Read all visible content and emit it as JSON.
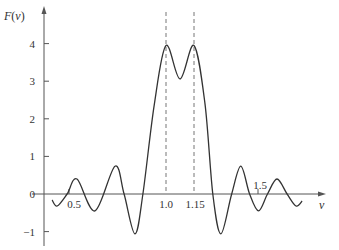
{
  "chart_data": {
    "type": "line",
    "title": "",
    "xlabel": "ν",
    "ylabel": "F(ν)",
    "ylabel_parts": {
      "func": "F",
      "open": "(",
      "var": "ν",
      "close": ")"
    },
    "xlim": [
      0.42,
      1.81
    ],
    "ylim": [
      -1.2,
      4.9
    ],
    "grid": false,
    "legend": "none",
    "x_ticks": [
      {
        "value": 0.5,
        "label": "0.5"
      },
      {
        "value": 1.0,
        "label": "1.0"
      },
      {
        "value": 1.15,
        "label": "1.15"
      },
      {
        "value": 1.5,
        "label": "1.5"
      }
    ],
    "y_ticks": [
      {
        "value": -1,
        "label": "−1"
      },
      {
        "value": 0,
        "label": "0"
      },
      {
        "value": 1,
        "label": "1"
      },
      {
        "value": 2,
        "label": "2"
      },
      {
        "value": 3,
        "label": "3"
      },
      {
        "value": 4,
        "label": "4"
      }
    ],
    "reference_lines": [
      {
        "x": 1.0,
        "style": "dashed"
      },
      {
        "x": 1.15,
        "style": "dashed"
      }
    ],
    "series": [
      {
        "name": "F(ν)",
        "x": [
          0.413,
          0.439,
          0.49,
          0.541,
          0.634,
          0.737,
          0.784,
          0.84,
          0.881,
          0.94,
          1.0,
          1.075,
          1.15,
          1.21,
          1.253,
          1.297,
          1.356,
          1.406,
          1.454,
          1.503,
          1.552,
          1.604,
          1.659,
          1.708,
          1.741
        ],
        "y": [
          -0.16,
          -0.32,
          0.0,
          0.4,
          -0.45,
          0.74,
          0.0,
          -1.06,
          0.0,
          2.4,
          3.95,
          3.06,
          3.95,
          2.4,
          0.0,
          -1.06,
          0.0,
          0.74,
          0.0,
          -0.45,
          0.0,
          0.4,
          0.0,
          -0.32,
          -0.19
        ]
      }
    ],
    "colors": {
      "curve": "#333333",
      "axis": "#555555",
      "dashed": "#777777"
    }
  }
}
